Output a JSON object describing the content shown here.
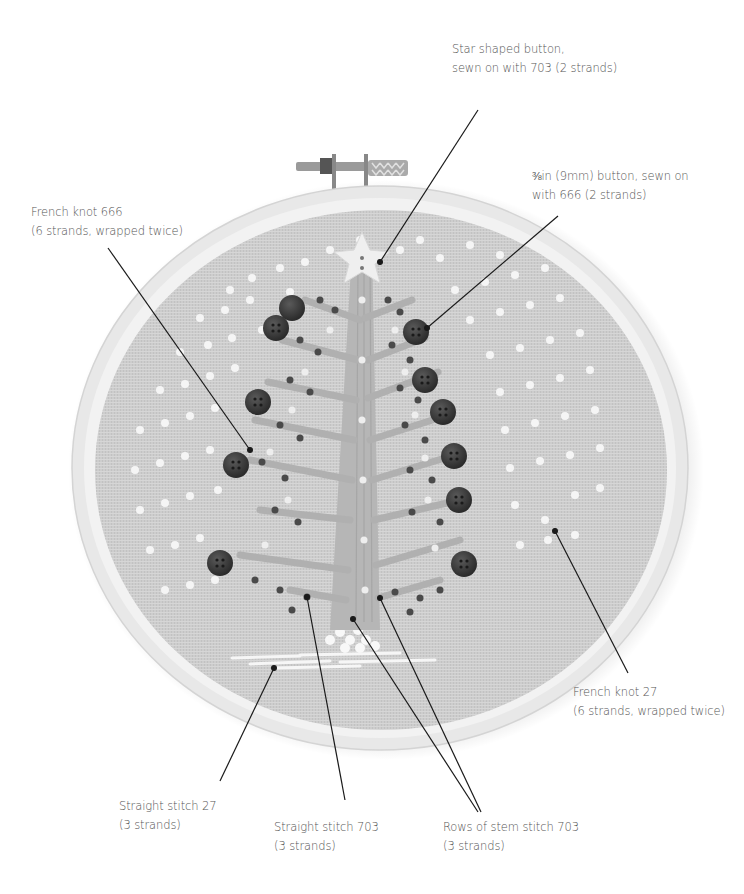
{
  "figure": {
    "colors": {
      "background": "#ffffff",
      "fabric": "#cfcfcf",
      "hoop": "#e6e6e6",
      "thread_703": "#b4b4b4",
      "thread_666_buttons": "#3c3c3c",
      "thread_27_knots": "#f4f4f4",
      "leader_line": "#1a1a1a",
      "label_text": "#555555"
    }
  },
  "annotations": [
    {
      "id": "star-button",
      "line1": "Star shaped button,",
      "line2": "sewn on with 703 (2 strands)"
    },
    {
      "id": "small-button",
      "line1": "⅜in (9mm) button, sewn on",
      "line2": "with 666 (2 strands)"
    },
    {
      "id": "french-knot-666",
      "line1": "French knot 666",
      "line2": "(6 strands, wrapped twice)"
    },
    {
      "id": "french-knot-27",
      "line1": "French knot 27",
      "line2": "(6 strands, wrapped twice)"
    },
    {
      "id": "straight-stitch-27",
      "line1": "Straight stitch 27",
      "line2": "(3 strands)"
    },
    {
      "id": "straight-stitch-703",
      "line1": "Straight stitch 703",
      "line2": "(3 strands)"
    },
    {
      "id": "stem-stitch-703",
      "line1": "Rows of stem stitch 703",
      "line2": "(3 strands)"
    }
  ]
}
